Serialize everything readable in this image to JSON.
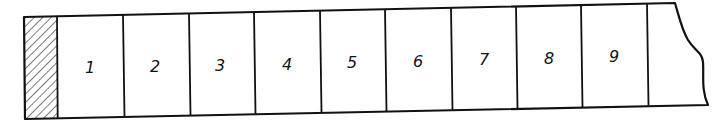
{
  "diagram": {
    "type": "segmented-strip",
    "hatched_end": "left",
    "break_line_end": "right",
    "line_color": "#111111",
    "background": "#ffffff",
    "cells": [
      {
        "label": "1"
      },
      {
        "label": "2"
      },
      {
        "label": "3"
      },
      {
        "label": "4"
      },
      {
        "label": "5"
      },
      {
        "label": "6"
      },
      {
        "label": "7"
      },
      {
        "label": "8"
      },
      {
        "label": "9"
      }
    ]
  }
}
